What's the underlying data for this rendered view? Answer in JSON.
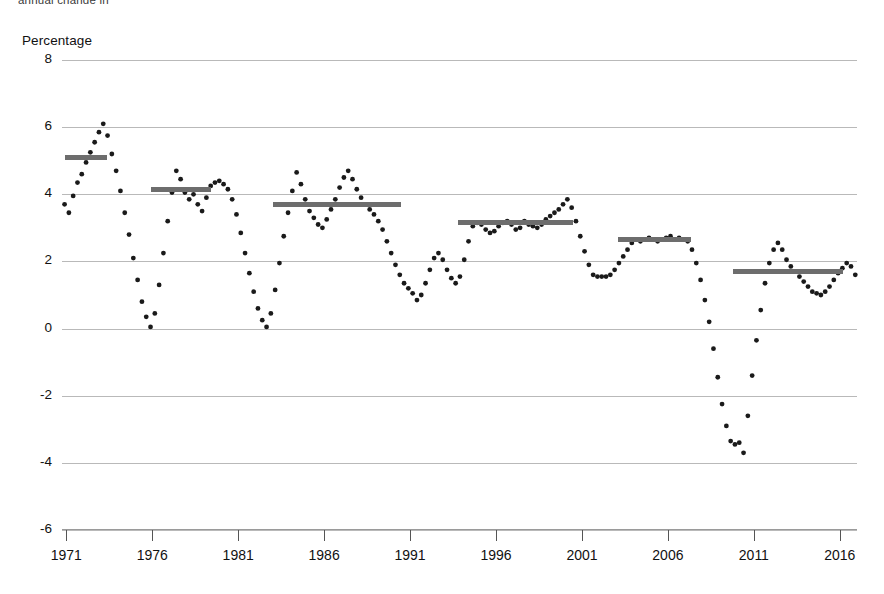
{
  "header": {
    "cut_title": "annual change  in",
    "axis_title": "Percentage"
  },
  "chart_data": {
    "type": "line",
    "title": "Percentage",
    "xlabel": "",
    "ylabel": "Percentage",
    "ylim": [
      -6,
      8
    ],
    "xlim": [
      1970.75,
      2017.0
    ],
    "grid": true,
    "legend": false,
    "marker": "dotted",
    "y_ticks": [
      8,
      6,
      4,
      2,
      0,
      -2,
      -4,
      -6
    ],
    "x_ticks": [
      1971,
      1976,
      1981,
      1986,
      1991,
      1996,
      2001,
      2006,
      2011,
      2016
    ],
    "x_tick_labels": [
      "1971",
      "1976",
      "1981",
      "1986",
      "1991",
      "1996",
      "2001",
      "2006",
      "2011",
      "2016"
    ],
    "series": [
      {
        "name": "Annual change",
        "x": [
          1970.9,
          1971.15,
          1971.4,
          1971.65,
          1971.9,
          1972.15,
          1972.4,
          1972.65,
          1972.9,
          1973.15,
          1973.4,
          1973.65,
          1973.9,
          1974.15,
          1974.4,
          1974.65,
          1974.9,
          1975.15,
          1975.4,
          1975.65,
          1975.9,
          1976.15,
          1976.4,
          1976.65,
          1976.9,
          1977.15,
          1977.4,
          1977.65,
          1977.9,
          1978.15,
          1978.4,
          1978.65,
          1978.9,
          1979.15,
          1979.4,
          1979.65,
          1979.9,
          1980.15,
          1980.4,
          1980.65,
          1980.9,
          1981.15,
          1981.4,
          1981.65,
          1981.9,
          1982.15,
          1982.4,
          1982.65,
          1982.9,
          1983.15,
          1983.4,
          1983.65,
          1983.9,
          1984.15,
          1984.4,
          1984.65,
          1984.9,
          1985.15,
          1985.4,
          1985.65,
          1985.9,
          1986.15,
          1986.4,
          1986.65,
          1986.9,
          1987.15,
          1987.4,
          1987.65,
          1987.9,
          1988.15,
          1988.4,
          1988.65,
          1988.9,
          1989.15,
          1989.4,
          1989.65,
          1989.9,
          1990.15,
          1990.4,
          1990.65,
          1990.9,
          1991.15,
          1991.4,
          1991.65,
          1991.9,
          1992.15,
          1992.4,
          1992.65,
          1992.9,
          1993.15,
          1993.4,
          1993.65,
          1993.9,
          1994.15,
          1994.4,
          1994.65,
          1994.9,
          1995.15,
          1995.4,
          1995.65,
          1995.9,
          1996.15,
          1996.4,
          1996.65,
          1996.9,
          1997.15,
          1997.4,
          1997.65,
          1997.9,
          1998.15,
          1998.4,
          1998.65,
          1998.9,
          1999.15,
          1999.4,
          1999.65,
          1999.9,
          2000.15,
          2000.4,
          2000.65,
          2000.9,
          2001.15,
          2001.4,
          2001.65,
          2001.9,
          2002.15,
          2002.4,
          2002.65,
          2002.9,
          2003.15,
          2003.4,
          2003.65,
          2003.9,
          2004.15,
          2004.4,
          2004.65,
          2004.9,
          2005.15,
          2005.4,
          2005.65,
          2005.9,
          2006.15,
          2006.4,
          2006.65,
          2006.9,
          2007.15,
          2007.4,
          2007.65,
          2007.9,
          2008.15,
          2008.4,
          2008.65,
          2008.9,
          2009.15,
          2009.4,
          2009.65,
          2009.9,
          2010.15,
          2010.4,
          2010.65,
          2010.9,
          2011.15,
          2011.4,
          2011.65,
          2011.9,
          2012.15,
          2012.4,
          2012.65,
          2012.9,
          2013.15,
          2013.4,
          2013.65,
          2013.9,
          2014.15,
          2014.4,
          2014.65,
          2014.9,
          2015.15,
          2015.4,
          2015.65,
          2015.9,
          2016.15,
          2016.4,
          2016.65,
          2016.9
        ],
        "y": [
          3.7,
          3.45,
          3.95,
          4.35,
          4.6,
          4.95,
          5.25,
          5.55,
          5.85,
          6.1,
          5.75,
          5.2,
          4.7,
          4.1,
          3.45,
          2.8,
          2.1,
          1.45,
          0.8,
          0.35,
          0.05,
          0.45,
          1.3,
          2.25,
          3.2,
          4.05,
          4.7,
          4.45,
          4.05,
          3.85,
          4.0,
          3.7,
          3.5,
          3.9,
          4.25,
          4.35,
          4.4,
          4.3,
          4.15,
          3.85,
          3.4,
          2.85,
          2.25,
          1.65,
          1.1,
          0.6,
          0.25,
          0.05,
          0.45,
          1.15,
          1.95,
          2.75,
          3.45,
          4.1,
          4.65,
          4.3,
          3.85,
          3.5,
          3.3,
          3.1,
          3.0,
          3.25,
          3.55,
          3.85,
          4.2,
          4.5,
          4.7,
          4.45,
          4.15,
          3.9,
          3.7,
          3.55,
          3.4,
          3.2,
          2.95,
          2.6,
          2.25,
          1.9,
          1.6,
          1.35,
          1.2,
          1.05,
          0.85,
          1.0,
          1.35,
          1.75,
          2.1,
          2.25,
          2.05,
          1.75,
          1.5,
          1.35,
          1.55,
          2.05,
          2.6,
          3.05,
          3.15,
          3.1,
          2.95,
          2.85,
          2.9,
          3.05,
          3.15,
          3.2,
          3.1,
          2.95,
          3.0,
          3.2,
          3.1,
          3.05,
          3.0,
          3.1,
          3.25,
          3.35,
          3.45,
          3.55,
          3.7,
          3.85,
          3.6,
          3.2,
          2.75,
          2.3,
          1.9,
          1.6,
          1.55,
          1.55,
          1.55,
          1.6,
          1.75,
          1.95,
          2.15,
          2.35,
          2.55,
          2.65,
          2.6,
          2.65,
          2.7,
          2.65,
          2.6,
          2.65,
          2.7,
          2.75,
          2.65,
          2.7,
          2.65,
          2.6,
          2.35,
          1.95,
          1.45,
          0.85,
          0.2,
          -0.6,
          -1.45,
          -2.25,
          -2.9,
          -3.35,
          -3.45,
          -3.4,
          -3.7,
          -2.6,
          -1.4,
          -0.35,
          0.55,
          1.35,
          1.95,
          2.35,
          2.55,
          2.35,
          2.05,
          1.85,
          1.7,
          1.55,
          1.4,
          1.25,
          1.1,
          1.05,
          1.0,
          1.1,
          1.25,
          1.45,
          1.65,
          1.8,
          1.95,
          1.85,
          1.6
        ]
      }
    ],
    "average_bars": [
      {
        "label": "cycle-average-1",
        "x_start": 1970.95,
        "x_end": 1973.35,
        "value": 5.1
      },
      {
        "label": "cycle-average-2",
        "x_start": 1975.95,
        "x_end": 1979.4,
        "value": 4.15
      },
      {
        "label": "cycle-average-3",
        "x_start": 1983.0,
        "x_end": 1990.45,
        "value": 3.7
      },
      {
        "label": "cycle-average-4",
        "x_start": 1993.8,
        "x_end": 2000.5,
        "value": 3.15
      },
      {
        "label": "cycle-average-5",
        "x_start": 2003.1,
        "x_end": 2007.35,
        "value": 2.65
      },
      {
        "label": "cycle-average-6",
        "x_start": 2009.8,
        "x_end": 2016.2,
        "value": 1.7
      }
    ]
  }
}
